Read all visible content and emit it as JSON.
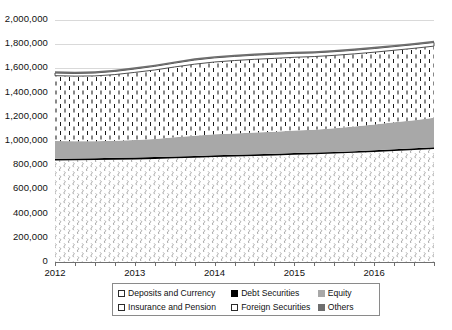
{
  "chart_data": {
    "type": "area",
    "title": "",
    "xlabel": "",
    "ylabel": "",
    "stacked": true,
    "grid": true,
    "legend_position": "bottom",
    "ylim": [
      0,
      2000000
    ],
    "yticks": [
      0,
      200000,
      400000,
      600000,
      800000,
      1000000,
      1200000,
      1400000,
      1600000,
      1800000,
      2000000
    ],
    "ytick_labels": [
      "0",
      "200,000",
      "400,000",
      "600,000",
      "800,000",
      "1,000,000",
      "1,200,000",
      "1,400,000",
      "1,600,000",
      "1,800,000",
      "2,000,000"
    ],
    "xtick_labels": [
      "2012",
      "2013",
      "2014",
      "2015",
      "2016"
    ],
    "x": [
      "2012Q1",
      "2012Q2",
      "2012Q3",
      "2012Q4",
      "2013Q1",
      "2013Q2",
      "2013Q3",
      "2013Q4",
      "2014Q1",
      "2014Q2",
      "2014Q3",
      "2014Q4",
      "2015Q1",
      "2015Q2",
      "2015Q3",
      "2015Q4",
      "2016Q1",
      "2016Q2",
      "2016Q3",
      "2016Q4"
    ],
    "series": [
      {
        "name": "Deposits and Currency",
        "pattern": "wavy-squiggle",
        "color": "#ffffff",
        "values": [
          838000,
          840000,
          842000,
          845000,
          848000,
          852000,
          857000,
          862000,
          868000,
          872000,
          876000,
          880000,
          886000,
          890000,
          896000,
          902000,
          910000,
          918000,
          926000,
          934000
        ]
      },
      {
        "name": "Debt Securities",
        "pattern": "solid",
        "color": "#000000",
        "values": [
          16000,
          16000,
          16000,
          16000,
          15000,
          15000,
          15000,
          15000,
          15000,
          15000,
          15000,
          15000,
          14000,
          14000,
          14000,
          14000,
          14000,
          14000,
          14000,
          14000
        ]
      },
      {
        "name": "Equity",
        "pattern": "solid",
        "color": "#a8a8a8",
        "values": [
          146000,
          142000,
          140000,
          142000,
          146000,
          150000,
          158000,
          166000,
          172000,
          176000,
          180000,
          182000,
          186000,
          190000,
          196000,
          204000,
          212000,
          222000,
          232000,
          244000
        ]
      },
      {
        "name": "Insurance and Pension",
        "pattern": "vertical-dash",
        "color": "#ffffff",
        "values": [
          540000,
          538000,
          540000,
          546000,
          558000,
          570000,
          582000,
          592000,
          598000,
          602000,
          604000,
          606000,
          606000,
          604000,
          602000,
          600000,
          598000,
          596000,
          594000,
          592000
        ]
      },
      {
        "name": "Foreign Securities",
        "pattern": "outline",
        "color": "#ffffff",
        "values": [
          22000,
          22000,
          24000,
          26000,
          28000,
          30000,
          32000,
          34000,
          34000,
          34000,
          34000,
          34000,
          32000,
          30000,
          30000,
          30000,
          30000,
          30000,
          30000,
          30000
        ]
      },
      {
        "name": "Others",
        "pattern": "solid",
        "color": "#6e6e6e",
        "values": [
          14000,
          14000,
          14000,
          14000,
          14000,
          14000,
          14000,
          14000,
          14000,
          14000,
          14000,
          14000,
          14000,
          14000,
          14000,
          14000,
          14000,
          14000,
          14000,
          14000
        ]
      }
    ],
    "totals": [
      1576000,
      1572000,
      1576000,
      1589000,
      1609000,
      1631000,
      1658000,
      1683000,
      1701000,
      1713000,
      1723000,
      1731000,
      1738000,
      1742000,
      1752000,
      1764000,
      1778000,
      1794000,
      1810000,
      1828000
    ]
  },
  "legend": {
    "items": [
      {
        "label": "Deposits and Currency",
        "swatch": "sw-deposits"
      },
      {
        "label": "Debt Securities",
        "swatch": "sw-debt"
      },
      {
        "label": "Equity",
        "swatch": "sw-equity"
      },
      {
        "label": "Insurance and Pension",
        "swatch": "sw-insurance"
      },
      {
        "label": "Foreign Securities",
        "swatch": "sw-foreign"
      },
      {
        "label": "Others",
        "swatch": "sw-others"
      }
    ]
  },
  "axes": {
    "y_labels": [
      "2,000,000",
      "1,800,000",
      "1,600,000",
      "1,400,000",
      "1,200,000",
      "1,000,000",
      "800,000",
      "600,000",
      "400,000",
      "200,000",
      "0"
    ],
    "x_labels": [
      "2012",
      "2013",
      "2014",
      "2015",
      "2016"
    ]
  },
  "colors": {
    "gridline": "#d9d9d9",
    "axis": "#6f6f6f",
    "equity": "#a8a8a8",
    "others": "#6e6e6e",
    "debt": "#000000",
    "text": "#111111"
  }
}
